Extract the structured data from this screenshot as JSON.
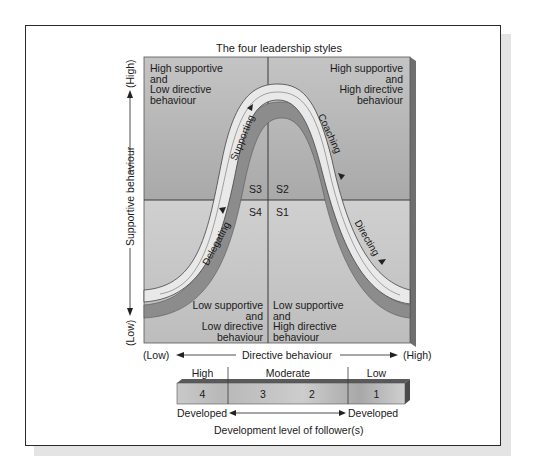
{
  "diagram": {
    "title": "The four leadership styles",
    "quadrants": {
      "top_left": "High supportive\nand\nLow directive\nbehaviour",
      "top_right": "High supportive\nand\nHigh directive\nbehaviour",
      "bottom_left": "Low supportive\nand\nLow directive\nbehaviour",
      "bottom_right": "Low supportive\nand\nHigh directive\nbehaviour"
    },
    "style_codes": {
      "s1": "S1",
      "s2": "S2",
      "s3": "S3",
      "s4": "S4"
    },
    "curve_labels": {
      "supporting": "Supporting",
      "coaching": "Coaching",
      "delegating": "Delegating",
      "directing": "Directing"
    },
    "y_axis": {
      "label": "Supportive behaviour",
      "high": "(High)",
      "low": "(Low)"
    },
    "x_axis": {
      "label": "Directive behaviour",
      "low": "(Low)",
      "high": "(High)"
    },
    "development_scale": {
      "groups": [
        {
          "label": "High",
          "numbers": [
            "4"
          ]
        },
        {
          "label": "Moderate",
          "numbers": [
            "3",
            "2"
          ]
        },
        {
          "label": "Low",
          "numbers": [
            "1"
          ]
        }
      ],
      "left_end": "Developed",
      "right_end": "Developed",
      "caption": "Development level of follower(s)"
    },
    "colors": {
      "quadrant_top": "#b4b4b4",
      "quadrant_bottom": "#c8c8c8",
      "curve_band_light": "#e8e8e8",
      "curve_band_dark": "#8a8a8a",
      "frame_border": "#2a2a2a"
    }
  }
}
